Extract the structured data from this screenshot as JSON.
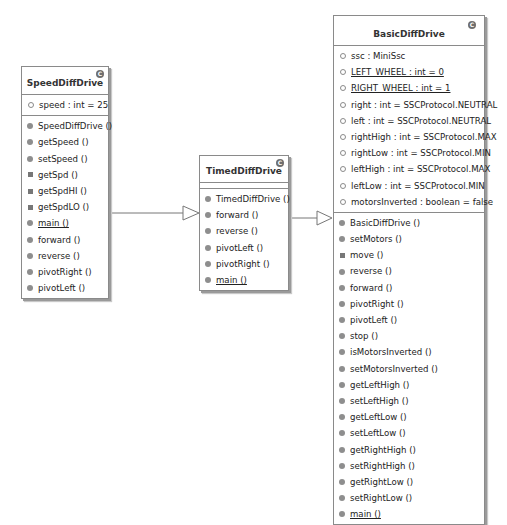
{
  "diagram": {
    "type": "uml-class-diagram",
    "classes": [
      {
        "name": "SpeedDiffDrive",
        "stereotype_icon": "C",
        "fields": [
          {
            "label": "speed : int = 25",
            "icon": "field",
            "static": false
          }
        ],
        "methods": [
          {
            "label": "SpeedDiffDrive ()",
            "icon": "pub",
            "static": false
          },
          {
            "label": "getSpeed ()",
            "icon": "pub",
            "static": false
          },
          {
            "label": "setSpeed ()",
            "icon": "pub",
            "static": false
          },
          {
            "label": "getSpd ()",
            "icon": "priv",
            "static": false
          },
          {
            "label": "getSpdHI ()",
            "icon": "priv",
            "static": false
          },
          {
            "label": "getSpdLO ()",
            "icon": "priv",
            "static": false
          },
          {
            "label": "main ()",
            "icon": "pub",
            "static": true
          },
          {
            "label": "forward ()",
            "icon": "pub",
            "static": false
          },
          {
            "label": "reverse ()",
            "icon": "pub",
            "static": false
          },
          {
            "label": "pivotRight ()",
            "icon": "pub",
            "static": false
          },
          {
            "label": "pivotLeft ()",
            "icon": "pub",
            "static": false
          }
        ]
      },
      {
        "name": "TimedDiffDrive",
        "stereotype_icon": "C",
        "fields": [],
        "methods": [
          {
            "label": "TimedDiffDrive ()",
            "icon": "pub",
            "static": false
          },
          {
            "label": "forward ()",
            "icon": "pub",
            "static": false
          },
          {
            "label": "reverse ()",
            "icon": "pub",
            "static": false
          },
          {
            "label": "pivotLeft ()",
            "icon": "pub",
            "static": false
          },
          {
            "label": "pivotRight ()",
            "icon": "pub",
            "static": false
          },
          {
            "label": "main ()",
            "icon": "pub",
            "static": true
          }
        ]
      },
      {
        "name": "BasicDiffDrive",
        "stereotype_icon": "C",
        "fields": [
          {
            "label": "ssc : MiniSsc",
            "icon": "field",
            "static": false
          },
          {
            "label": "LEFT_WHEEL : int = 0",
            "icon": "field",
            "static": true
          },
          {
            "label": "RIGHT_WHEEL : int = 1",
            "icon": "field",
            "static": true
          },
          {
            "label": "right : int = SSCProtocol.NEUTRAL",
            "icon": "field",
            "static": false
          },
          {
            "label": "left : int = SSCProtocol.NEUTRAL",
            "icon": "field",
            "static": false
          },
          {
            "label": "rightHigh : int = SSCProtocol.MAX",
            "icon": "field",
            "static": false
          },
          {
            "label": "rightLow : int = SSCProtocol.MIN",
            "icon": "field",
            "static": false
          },
          {
            "label": "leftHigh : int = SSCProtocol.MAX",
            "icon": "field",
            "static": false
          },
          {
            "label": "leftLow : int = SSCProtocol.MIN",
            "icon": "field",
            "static": false
          },
          {
            "label": "motorsInverted : boolean = false",
            "icon": "field",
            "static": false
          }
        ],
        "methods": [
          {
            "label": "BasicDiffDrive ()",
            "icon": "pub",
            "static": false
          },
          {
            "label": "setMotors ()",
            "icon": "pub",
            "static": false
          },
          {
            "label": "move ()",
            "icon": "priv",
            "static": false
          },
          {
            "label": "reverse ()",
            "icon": "pub",
            "static": false
          },
          {
            "label": "forward ()",
            "icon": "pub",
            "static": false
          },
          {
            "label": "pivotRight ()",
            "icon": "pub",
            "static": false
          },
          {
            "label": "pivotLeft ()",
            "icon": "pub",
            "static": false
          },
          {
            "label": "stop ()",
            "icon": "pub",
            "static": false
          },
          {
            "label": "isMotorsInverted ()",
            "icon": "pub",
            "static": false
          },
          {
            "label": "setMotorsInverted ()",
            "icon": "pub",
            "static": false
          },
          {
            "label": "getLeftHigh ()",
            "icon": "pub",
            "static": false
          },
          {
            "label": "setLeftHigh ()",
            "icon": "pub",
            "static": false
          },
          {
            "label": "getLeftLow ()",
            "icon": "pub",
            "static": false
          },
          {
            "label": "setLeftLow ()",
            "icon": "pub",
            "static": false
          },
          {
            "label": "getRightHigh ()",
            "icon": "pub",
            "static": false
          },
          {
            "label": "setRightHigh ()",
            "icon": "pub",
            "static": false
          },
          {
            "label": "getRightLow ()",
            "icon": "pub",
            "static": false
          },
          {
            "label": "setRightLow ()",
            "icon": "pub",
            "static": false
          },
          {
            "label": "main ()",
            "icon": "pub",
            "static": true
          }
        ]
      }
    ],
    "relations": [
      {
        "from": "SpeedDiffDrive",
        "to": "TimedDiffDrive",
        "type": "generalization"
      },
      {
        "from": "TimedDiffDrive",
        "to": "BasicDiffDrive",
        "type": "generalization"
      }
    ],
    "colors": {
      "border": "#8a8a8a",
      "shadow": "#9a9a9a",
      "icon": "#8e8e8e",
      "text": "#222222"
    }
  }
}
